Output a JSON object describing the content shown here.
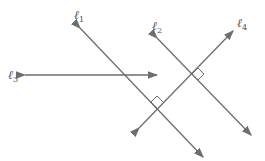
{
  "diagram": {
    "line_color": "#6e6e6e",
    "lines": [
      {
        "id": "l1",
        "label": "ℓ",
        "subscript": "1",
        "x1": 80,
        "y1": 28,
        "x2": 203,
        "y2": 157
      },
      {
        "id": "l2",
        "label": "ℓ",
        "subscript": "2",
        "x1": 157,
        "y1": 38,
        "x2": 251,
        "y2": 135
      },
      {
        "id": "l3",
        "label": "ℓ",
        "subscript": "3",
        "x1": 25,
        "y1": 75,
        "x2": 157,
        "y2": 75
      },
      {
        "id": "l4",
        "label": "ℓ",
        "subscript": "4",
        "x1": 139,
        "y1": 128,
        "x2": 233,
        "y2": 31
      }
    ],
    "right_angle_marks": [
      {
        "at": "l2-l4",
        "x": 192,
        "y": 74
      },
      {
        "at": "l1-l4",
        "x": 157,
        "y": 108
      }
    ]
  }
}
